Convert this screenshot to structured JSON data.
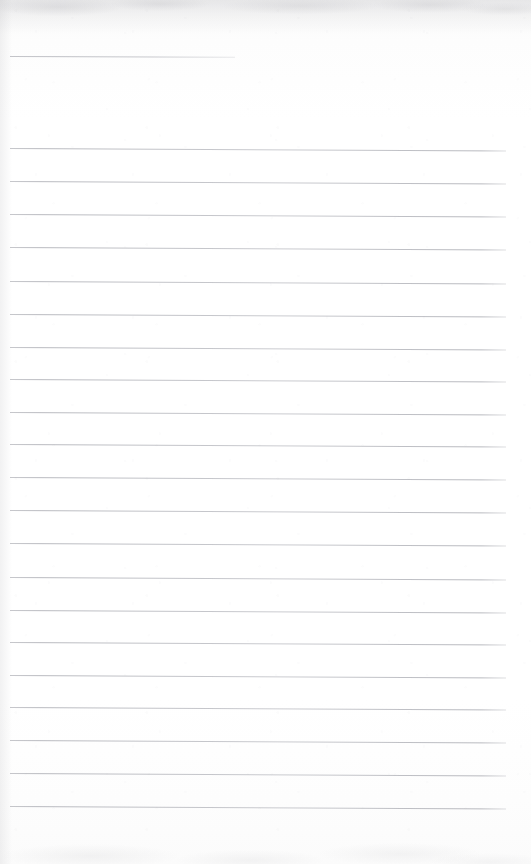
{
  "document": {
    "kind": "scanned-document",
    "subject": "blank ruled notepad page",
    "page_label": "",
    "body_text": "",
    "colors": {
      "paper": "#fdfdfd",
      "rule": "#8a8c96",
      "edge_shadow": "#9a9aa0"
    },
    "canvas": {
      "width": 531,
      "height": 864
    }
  },
  "ruling": {
    "style": "wide-ruled",
    "line_spacing_px": 33,
    "line_thickness_px": 1,
    "left_margin_px": 10,
    "right_edge_px": 506,
    "tilt_deg": 0.28,
    "vertical_margin_rule": false,
    "full_line_count": 21,
    "short_line_count": 1,
    "short_line": {
      "name": "header-rule",
      "y": 56,
      "x_start": 10,
      "x_end": 235,
      "tilt_deg": 0.22
    },
    "full_lines": [
      {
        "y": 148
      },
      {
        "y": 181
      },
      {
        "y": 214
      },
      {
        "y": 247
      },
      {
        "y": 281
      },
      {
        "y": 314
      },
      {
        "y": 347
      },
      {
        "y": 379
      },
      {
        "y": 412
      },
      {
        "y": 444
      },
      {
        "y": 477
      },
      {
        "y": 510
      },
      {
        "y": 543
      },
      {
        "y": 577
      },
      {
        "y": 610
      },
      {
        "y": 642
      },
      {
        "y": 675
      },
      {
        "y": 707
      },
      {
        "y": 740
      },
      {
        "y": 773
      },
      {
        "y": 806
      }
    ]
  },
  "artifacts": {
    "top_smudge": {
      "present": true,
      "height_px": 34
    },
    "left_edge_shadow": {
      "present": true,
      "width_px": 12
    },
    "bottom_smudge": {
      "present": true,
      "height_px": 60
    },
    "speckle_noise": {
      "present": true
    }
  }
}
